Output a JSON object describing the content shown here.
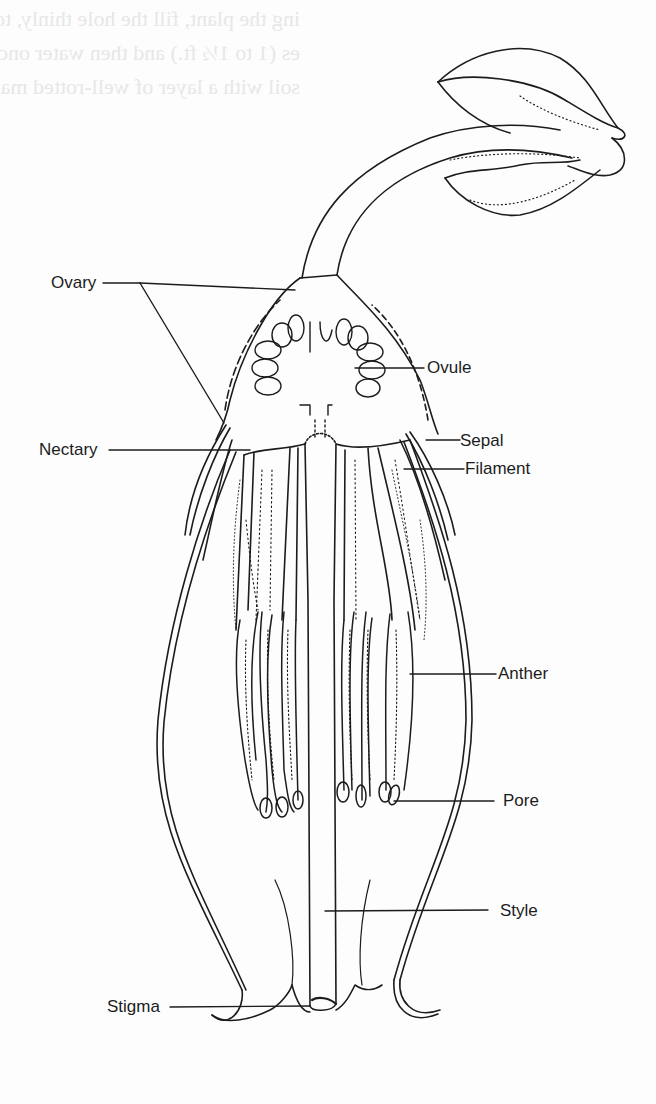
{
  "figure": {
    "type": "botanical cross-section diagram",
    "ink_color": "#1c1c1c",
    "paper_color": "#fdfdfd",
    "bleed_through_color": "#e7e7e7"
  },
  "labels": {
    "ovary": "Ovary",
    "ovule": "Ovule",
    "nectary": "Nectary",
    "sepal": "Sepal",
    "filament": "Filament",
    "anther": "Anther",
    "pore": "Pore",
    "style": "Style",
    "stigma": "Stigma"
  },
  "bleed_through_text": [
    "ing the plant, fill the hole thinly, topdress fill with soil",
    "es (1 to 1½ ft.) and then water once weekly. Fill the soil",
    "soil with a layer of well-rotted manure."
  ]
}
